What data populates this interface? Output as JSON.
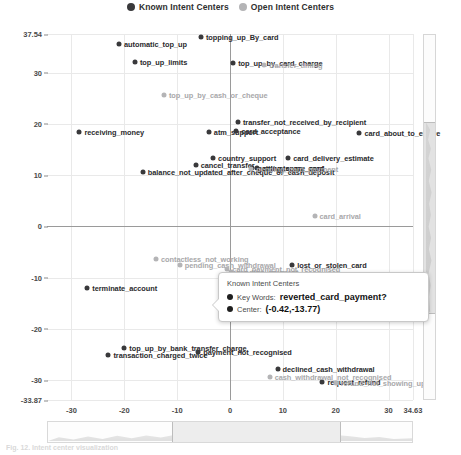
{
  "legend": {
    "items": [
      {
        "label": "Known Intent Centers",
        "color": "#39393b",
        "icon": "filled-circle-icon"
      },
      {
        "label": "Open Intent Centers",
        "color": "#b4b4b6",
        "icon": "filled-circle-icon"
      }
    ]
  },
  "tooltip": {
    "title": "Known Intent Centers",
    "keywords_label": "Key Words:",
    "keywords_value": "reverted_card_payment?",
    "center_label": "Center:",
    "center_value": "(-0.42,-13.77)"
  },
  "caption": "Fig. 12. Intent center visualization",
  "chart_data": {
    "type": "scatter",
    "title": "",
    "xlabel": "",
    "ylabel": "",
    "xlim": [
      -34.63,
      34.63
    ],
    "ylim": [
      -33.87,
      37.54
    ],
    "grid": true,
    "legend_position": "top-center",
    "xticks": [
      "-30",
      "-20",
      "-10",
      "0",
      "10",
      "20",
      "30",
      "34.63"
    ],
    "xtick_values": [
      -30,
      -20,
      -10,
      0,
      10,
      20,
      30,
      34.63
    ],
    "yticks": [
      "37.54",
      "30",
      "20",
      "10",
      "0",
      "-10",
      "-20",
      "-30",
      "-33.87"
    ],
    "ytick_values": [
      37.54,
      30,
      20,
      10,
      0,
      -10,
      -20,
      -30,
      -33.87
    ],
    "series": [
      {
        "name": "Known Intent Centers",
        "color": "#39393b",
        "points": [
          {
            "label": "automatic_top_up",
            "x": -21.0,
            "y": 35.6,
            "side": "right"
          },
          {
            "label": "topping_up_By_card",
            "x": -5.5,
            "y": 36.9,
            "side": "right"
          },
          {
            "label": "top_up_limits",
            "x": -18.0,
            "y": 32.0,
            "side": "right"
          },
          {
            "label": "top_up_by_card_charge",
            "x": 0.6,
            "y": 31.8,
            "side": "right"
          },
          {
            "label": "receiving_money",
            "x": -28.5,
            "y": 18.5,
            "side": "right"
          },
          {
            "label": "atm_support",
            "x": -4.0,
            "y": 18.5,
            "side": "right"
          },
          {
            "label": "transfer_not_received_by_recipient",
            "x": 1.5,
            "y": 20.3,
            "side": "right"
          },
          {
            "label": "card_acceptance",
            "x": 1.2,
            "y": 18.7,
            "side": "right"
          },
          {
            "label": "card_about_to_expire",
            "x": 24.5,
            "y": 18.2,
            "side": "right"
          },
          {
            "label": "country_support",
            "x": -3.2,
            "y": 13.3,
            "side": "right"
          },
          {
            "label": "cancel_transfer",
            "x": -6.5,
            "y": 11.9,
            "side": "right"
          },
          {
            "label": "balance_not_updated_after_cheque_or_cash_deposit",
            "x": -16.5,
            "y": 10.6,
            "side": "right"
          },
          {
            "label": "card_delivery_estimate",
            "x": 11.0,
            "y": 13.3,
            "side": "right"
          },
          {
            "label": "getting_spare_card",
            "x": 4.2,
            "y": 11.4,
            "side": "right"
          },
          {
            "label": "activate_my_card",
            "x": 5.2,
            "y": 11.3,
            "side": "right"
          },
          {
            "label": "lost_or_stolen_card",
            "x": 11.8,
            "y": -7.5,
            "side": "right"
          },
          {
            "label": "terminate_account",
            "x": -27.0,
            "y": -12.0,
            "side": "right"
          },
          {
            "label": "card_payment_not_showed",
            "x": 10.3,
            "y": -11.9,
            "side": "right"
          },
          {
            "label": "reverted_card_payment?",
            "x": -0.42,
            "y": -13.77,
            "side": "right"
          },
          {
            "label": "transaction_charged_twice",
            "x": -23.0,
            "y": -25.0,
            "side": "right"
          },
          {
            "label": "top_up_by_bank_transfer_charge",
            "x": -20.0,
            "y": -23.8,
            "side": "right"
          },
          {
            "label": "payment_not_recognised",
            "x": -6.0,
            "y": -24.5,
            "side": "right"
          },
          {
            "label": "declined_cash_withdrawal",
            "x": 9.0,
            "y": -27.8,
            "side": "right"
          },
          {
            "label": "request_refund",
            "x": 17.5,
            "y": -30.4,
            "side": "right"
          }
        ]
      },
      {
        "name": "Open Intent Centers",
        "color": "#b4b4b6",
        "points": [
          {
            "label": "transfer_timing",
            "x": 6.5,
            "y": 31.4,
            "side": "right"
          },
          {
            "label": "top_up_by_cash_or_cheque",
            "x": -12.5,
            "y": 25.6,
            "side": "right"
          },
          {
            "label": "pending_card_payment",
            "x": 4.0,
            "y": 11.2,
            "side": "right"
          },
          {
            "label": "card_arrival",
            "x": 16.0,
            "y": 2.1,
            "side": "right"
          },
          {
            "label": "contactless_not_working",
            "x": -14.0,
            "y": -6.4,
            "side": "right"
          },
          {
            "label": "pending_cash_withdrawal",
            "x": -9.5,
            "y": -7.6,
            "side": "right"
          },
          {
            "label": "card_payment_not_recognised",
            "x": -0.5,
            "y": -8.3,
            "side": "right"
          },
          {
            "label": "pending_payment",
            "x": 0.2,
            "y": -8.8,
            "side": "right"
          },
          {
            "label": "card_not_working",
            "x": -0.8,
            "y": -11.8,
            "side": "right"
          },
          {
            "label": "cash_withdrawal_not_recognised",
            "x": 7.5,
            "y": -29.3,
            "side": "right"
          },
          {
            "label": "refund_not_showing_up",
            "x": 20.0,
            "y": -30.6,
            "side": "right"
          }
        ]
      }
    ]
  }
}
